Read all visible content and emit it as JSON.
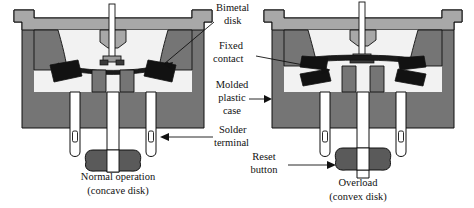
{
  "figure": {
    "background_color": "#ffffff"
  },
  "colors": {
    "case_body": "#757575",
    "case_cap": "#a8a8a8",
    "case_interior": "#f2f2f2",
    "contact_black": "#121212",
    "disk_black": "#1a1a1a",
    "terminal_fill": "#ffffff",
    "reset_button": "#5a5a5a",
    "outline": "#111111",
    "text": "#111111"
  },
  "labels": [
    {
      "id": "bimetal-disk",
      "lines": [
        "Bimetal",
        "disk"
      ],
      "align": "left",
      "x": 216,
      "y": 9,
      "line_height": 13
    },
    {
      "id": "fixed-contact",
      "lines": [
        "Fixed",
        "contact"
      ],
      "align": "left",
      "x": 216,
      "y": 47,
      "line_height": 13
    },
    {
      "id": "molded-case",
      "lines": [
        "Molded",
        "plastic",
        "case"
      ],
      "align": "center",
      "x": 232,
      "y": 86,
      "line_height": 13
    },
    {
      "id": "solder-terminal",
      "lines": [
        "Solder",
        "terminal"
      ],
      "align": "left",
      "x": 216,
      "y": 131,
      "line_height": 13
    },
    {
      "id": "reset-button",
      "lines": [
        "Reset",
        "button"
      ],
      "align": "center",
      "x": 264,
      "y": 158,
      "line_height": 13
    }
  ],
  "captions": [
    {
      "id": "caption-left",
      "lines": [
        "Normal operation",
        "(concave disk)"
      ],
      "x": 118,
      "y": 178,
      "line_height": 14
    },
    {
      "id": "caption-right",
      "lines": [
        "Overload",
        "(convex disk)"
      ],
      "x": 358,
      "y": 184,
      "line_height": 14
    }
  ],
  "diagrams": [
    {
      "id": "diagram-normal",
      "state": "Normal operation",
      "disk_shape": "concave disk",
      "contacts_closed": true,
      "terminal_count": 3
    },
    {
      "id": "diagram-overload",
      "state": "Overload",
      "disk_shape": "convex disk",
      "contacts_closed": false,
      "terminal_count": 3
    }
  ]
}
